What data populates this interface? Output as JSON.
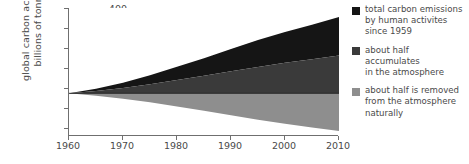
{
  "axes": {
    "ylabel_line1": "global carbon accumulation/",
    "ylabel_line2": "billions of tonnes",
    "yticks": [
      "400",
      "300",
      "200",
      "100",
      "0",
      "−100",
      "−200"
    ],
    "xticks": [
      "1960",
      "1970",
      "1980",
      "1990",
      "2000",
      "2010"
    ]
  },
  "legend": {
    "items": [
      {
        "color": "#151515",
        "lines": [
          "total carbon emissions",
          "by human activites",
          "since 1959"
        ]
      },
      {
        "color": "#3a3a3a",
        "lines": [
          "about half",
          "accumulates",
          "in the atmosphere"
        ]
      },
      {
        "color": "#8e8e8e",
        "lines": [
          "about half is removed",
          "from the atmosphere",
          "naturally"
        ]
      }
    ]
  },
  "chart_data": {
    "type": "area",
    "title": "",
    "xlabel": "",
    "ylabel": "global carbon accumulation/ billions of tonnes",
    "xlim": [
      1960,
      2010
    ],
    "ylim": [
      -200,
      400
    ],
    "grid": false,
    "legend_position": "right",
    "x": [
      1960,
      1965,
      1970,
      1975,
      1980,
      1985,
      1990,
      1995,
      2000,
      2005,
      2010
    ],
    "series": [
      {
        "name": "total carbon emissions by human activites since 1959",
        "color": "#151515",
        "band": "upper",
        "values": [
          0,
          22,
          50,
          85,
          125,
          165,
          208,
          250,
          288,
          322,
          358
        ]
      },
      {
        "name": "about half accumulates in the atmosphere",
        "color": "#3a3a3a",
        "band": "middle",
        "values": [
          0,
          11,
          25,
          42,
          62,
          82,
          103,
          124,
          143,
          160,
          177
        ]
      },
      {
        "name": "about half is removed from the atmosphere naturally",
        "color": "#8e8e8e",
        "band": "lower",
        "values": [
          0,
          -11,
          -25,
          -42,
          -62,
          -82,
          -103,
          -124,
          -143,
          -160,
          -177
        ]
      }
    ]
  }
}
